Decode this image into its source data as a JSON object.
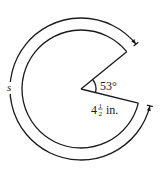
{
  "diagram": {
    "type": "circular-sector-arc-length",
    "central_angle_deg": 53,
    "angle_label": "53°",
    "radius_label": {
      "whole": "4",
      "numerator": "1",
      "denominator": "2",
      "unit": "in."
    },
    "arc_label": "s",
    "colors": {
      "stroke": "#1a1a1a",
      "background": "#ffffff"
    }
  }
}
